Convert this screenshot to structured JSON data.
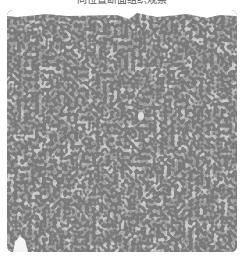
{
  "figure": {
    "caption": "同位置断面组织观察",
    "image_description": "grayscale histology micrograph of tissue with densely scattered dark nuclei",
    "colors": {
      "background": "#ffffff",
      "tissue_base": "#8f8f8f",
      "nuclei": "#3a3a3a",
      "caption_text": "#555555"
    }
  }
}
